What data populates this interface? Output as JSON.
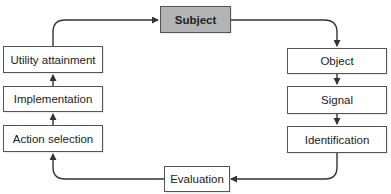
{
  "caption": "Fig... [partially cut off]",
  "diagram": {
    "type": "cycle flowchart",
    "nodes": [
      {
        "id": "subject",
        "label": "Subject",
        "highlight": true
      },
      {
        "id": "object",
        "label": "Object"
      },
      {
        "id": "signal",
        "label": "Signal"
      },
      {
        "id": "identification",
        "label": "Identification"
      },
      {
        "id": "evaluation",
        "label": "Evaluation"
      },
      {
        "id": "action_selection",
        "label": "Action selection"
      },
      {
        "id": "implementation",
        "label": "Implementation"
      },
      {
        "id": "utility_attainment",
        "label": "Utility attainment"
      }
    ],
    "edges": [
      {
        "from": "subject",
        "to": "object"
      },
      {
        "from": "object",
        "to": "signal"
      },
      {
        "from": "signal",
        "to": "identification"
      },
      {
        "from": "identification",
        "to": "evaluation"
      },
      {
        "from": "evaluation",
        "to": "action_selection"
      },
      {
        "from": "action_selection",
        "to": "implementation"
      },
      {
        "from": "implementation",
        "to": "utility_attainment"
      },
      {
        "from": "utility_attainment",
        "to": "subject"
      }
    ],
    "colors": {
      "highlight_fill": "#b4b4b4",
      "stroke": "#333333"
    }
  }
}
